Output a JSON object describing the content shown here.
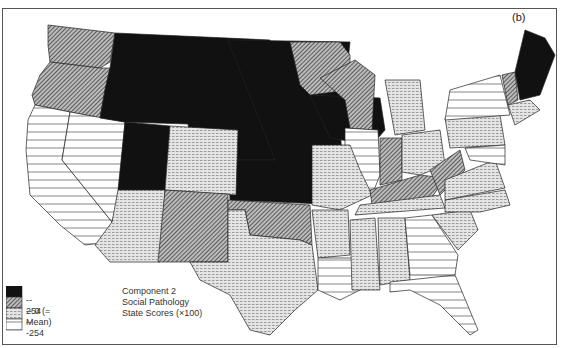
{
  "panel_label": "(b)",
  "caption": {
    "line1": "Component 2",
    "line2": "Social Pathology",
    "line3": "State Scores (×100)"
  },
  "legend": {
    "items": [
      {
        "label": "-- 254",
        "pattern": "solid-black"
      },
      {
        "label": "-- 0 (= Mean)",
        "pattern": "diagonal-hatch"
      },
      {
        "label": "-- -254",
        "pattern": "dashed-dots"
      },
      {
        "label": "",
        "pattern": "horizontal-lines"
      }
    ]
  },
  "map": {
    "title": "United States map of state scores",
    "categories": {
      "highest": [
        "Idaho",
        "Montana",
        "Wyoming",
        "Utah",
        "North Dakota",
        "South Dakota",
        "Nebraska",
        "Kansas",
        "Iowa",
        "Maine",
        "New Hampshire"
      ],
      "above_mean": [
        "Washington",
        "Oregon",
        "Minnesota",
        "Wisconsin",
        "New Mexico",
        "Oklahoma",
        "Indiana",
        "Kentucky",
        "West Virginia",
        "Vermont"
      ],
      "below_mean": [
        "Colorado",
        "Arizona",
        "Texas",
        "Missouri",
        "Arkansas",
        "Michigan",
        "Ohio",
        "Tennessee",
        "Mississippi",
        "Alabama",
        "South Carolina",
        "North Carolina",
        "Virginia",
        "Pennsylvania",
        "New Jersey",
        "Massachusetts",
        "Connecticut",
        "Rhode Island",
        "Delaware"
      ],
      "lowest": [
        "California",
        "Nevada",
        "Illinois",
        "Louisiana",
        "Georgia",
        "Florida",
        "New York",
        "Maryland"
      ]
    }
  }
}
